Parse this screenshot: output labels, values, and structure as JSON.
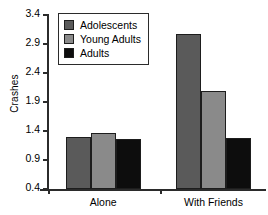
{
  "chart_data": {
    "type": "bar",
    "title": "",
    "xlabel": "",
    "ylabel": "Crashes",
    "categories": [
      "Alone",
      "With Friends"
    ],
    "series": [
      {
        "name": "Adolescents",
        "color": "#5a5a5a",
        "values": [
          1.29,
          3.07
        ]
      },
      {
        "name": "Young Adults",
        "color": "#8a8a8a",
        "values": [
          1.36,
          2.09
        ]
      },
      {
        "name": "Adults",
        "color": "#0d0d0d",
        "values": [
          1.27,
          1.28
        ]
      }
    ],
    "ylim": [
      0.4,
      3.4
    ],
    "yticks": [
      "0.4",
      "0.9",
      "1.4",
      "1.9",
      "2.4",
      "2.9",
      "3.4"
    ],
    "grid": false,
    "legend_position": "top-left"
  },
  "axis": {
    "y_label": "Crashes",
    "ticks": [
      {
        "label": "3.4",
        "value": 3.4
      },
      {
        "label": "2.9",
        "value": 2.9
      },
      {
        "label": "2.4",
        "value": 2.4
      },
      {
        "label": "1.9",
        "value": 1.9
      },
      {
        "label": "1.4",
        "value": 1.4
      },
      {
        "label": "0.9",
        "value": 0.9
      },
      {
        "label": "0.4",
        "value": 0.4
      }
    ]
  },
  "groups": [
    {
      "label": "Alone"
    },
    {
      "label": "With Friends"
    }
  ],
  "legend": {
    "items": [
      {
        "label": "Adolescents",
        "color": "#5a5a5a"
      },
      {
        "label": "Young Adults",
        "color": "#8a8a8a"
      },
      {
        "label": "Adults",
        "color": "#0d0d0d"
      }
    ]
  }
}
